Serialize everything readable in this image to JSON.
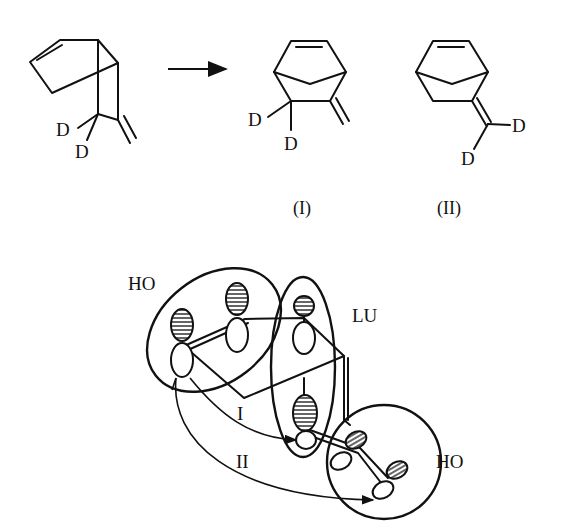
{
  "reaction": {
    "reactant": {
      "labels": [
        "D",
        "D"
      ]
    },
    "arrow": "reaction-arrow",
    "products": [
      {
        "id": "I",
        "caption": "(I)",
        "labels": [
          "D",
          "D"
        ]
      },
      {
        "id": "II",
        "caption": "(II)",
        "labels": [
          "D",
          "D"
        ]
      }
    ]
  },
  "orbital_diagram": {
    "fragments": [
      {
        "label": "HO",
        "position": "upper-left"
      },
      {
        "label": "LU",
        "position": "center"
      },
      {
        "label": "HO",
        "position": "lower-right"
      }
    ],
    "pathways": [
      {
        "label": "I"
      },
      {
        "label": "II"
      }
    ]
  }
}
